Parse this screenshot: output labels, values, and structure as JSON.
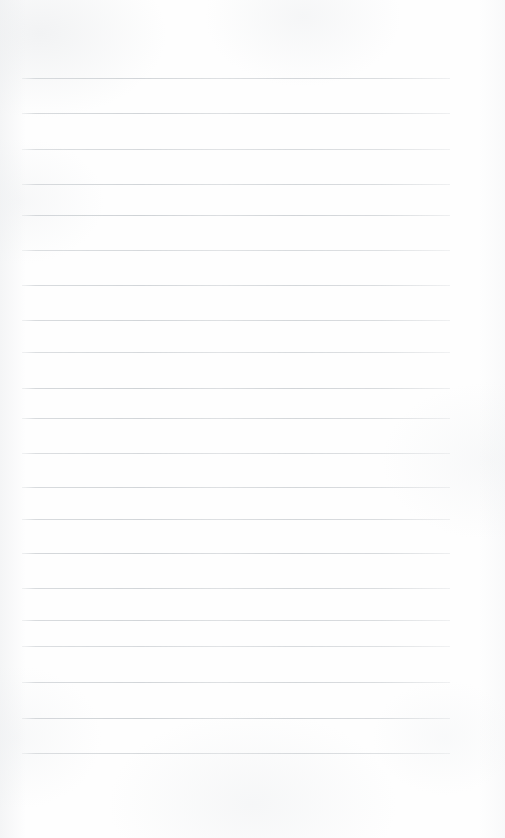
{
  "document": {
    "kind": "ruled-notebook-page",
    "title": "Blank Ruled Notebook Page",
    "page_width": 505,
    "page_height": 838,
    "paper_color": "#fefefe",
    "is_blank": true,
    "written_text": "",
    "header_text": "",
    "footer_text": "",
    "page_number": ""
  },
  "ruling": {
    "line_color": "#c9cdd1",
    "line_thickness_px": 1,
    "line_count": 20,
    "line_spacing_px": 35.5,
    "first_line_y": 78,
    "last_line_y": 753,
    "line_start_x": 22,
    "line_end_x": 450,
    "top_margin_px": 78,
    "bottom_margin_px": 85,
    "left_margin_px": 22,
    "right_margin_px": 55,
    "has_vertical_margin_rule": false,
    "lines": [
      {
        "index": 1,
        "y": 78,
        "x1": 22,
        "x2": 450,
        "content": ""
      },
      {
        "index": 2,
        "y": 113,
        "x1": 22,
        "x2": 450,
        "content": ""
      },
      {
        "index": 3,
        "y": 149,
        "x1": 22,
        "x2": 450,
        "content": ""
      },
      {
        "index": 4,
        "y": 184,
        "x1": 22,
        "x2": 450,
        "content": ""
      },
      {
        "index": 5,
        "y": 215,
        "x1": 22,
        "x2": 450,
        "content": ""
      },
      {
        "index": 6,
        "y": 250,
        "x1": 22,
        "x2": 450,
        "content": ""
      },
      {
        "index": 7,
        "y": 285,
        "x1": 22,
        "x2": 450,
        "content": ""
      },
      {
        "index": 8,
        "y": 320,
        "x1": 22,
        "x2": 450,
        "content": ""
      },
      {
        "index": 9,
        "y": 352,
        "x1": 22,
        "x2": 450,
        "content": ""
      },
      {
        "index": 10,
        "y": 388,
        "x1": 22,
        "x2": 450,
        "content": ""
      },
      {
        "index": 11,
        "y": 418,
        "x1": 22,
        "x2": 450,
        "content": ""
      },
      {
        "index": 12,
        "y": 453,
        "x1": 22,
        "x2": 450,
        "content": ""
      },
      {
        "index": 13,
        "y": 487,
        "x1": 22,
        "x2": 450,
        "content": ""
      },
      {
        "index": 14,
        "y": 519,
        "x1": 22,
        "x2": 450,
        "content": ""
      },
      {
        "index": 15,
        "y": 553,
        "x1": 22,
        "x2": 450,
        "content": ""
      },
      {
        "index": 16,
        "y": 588,
        "x1": 22,
        "x2": 450,
        "content": ""
      },
      {
        "index": 17,
        "y": 620,
        "x1": 22,
        "x2": 450,
        "content": ""
      },
      {
        "index": 18,
        "y": 646,
        "x1": 22,
        "x2": 450,
        "content": ""
      },
      {
        "index": 19,
        "y": 682,
        "x1": 22,
        "x2": 450,
        "content": ""
      },
      {
        "index": 20,
        "y": 718,
        "x1": 22,
        "x2": 450,
        "content": ""
      },
      {
        "index": 21,
        "y": 753,
        "x1": 22,
        "x2": 450,
        "content": ""
      }
    ]
  }
}
